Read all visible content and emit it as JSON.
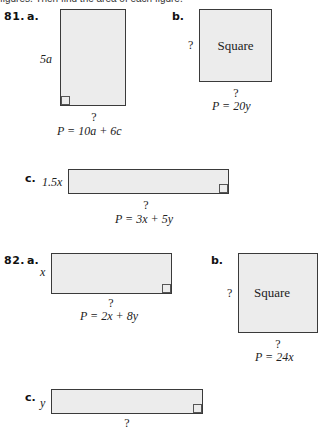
{
  "instruction": "figures. Then find the area of each figure.",
  "problems": [
    {
      "number": "81.",
      "parts": [
        {
          "label": "a.",
          "shape": "rectangle",
          "side_label": "5a",
          "bottom_label": "?",
          "perimeter": "P = 10a + 6c"
        },
        {
          "label": "b.",
          "shape": "square",
          "inner_text": "Square",
          "side_label": "?",
          "bottom_label": "?",
          "perimeter": "P = 20y"
        },
        {
          "label": "c.",
          "shape": "rectangle",
          "side_label": "1.5x",
          "bottom_label": "?",
          "perimeter": "P = 3x + 5y"
        }
      ]
    },
    {
      "number": "82.",
      "parts": [
        {
          "label": "a.",
          "shape": "rectangle",
          "side_label": "x",
          "bottom_label": "?",
          "perimeter": "P = 2x + 8y"
        },
        {
          "label": "b.",
          "shape": "square",
          "inner_text": "Square",
          "side_label": "?",
          "bottom_label": "?",
          "perimeter": "P = 24x"
        },
        {
          "label": "c.",
          "shape": "rectangle",
          "side_label": "y",
          "bottom_label": "?"
        }
      ]
    }
  ],
  "colors": {
    "fill": "#ececec",
    "stroke": "#3a3a3a"
  }
}
